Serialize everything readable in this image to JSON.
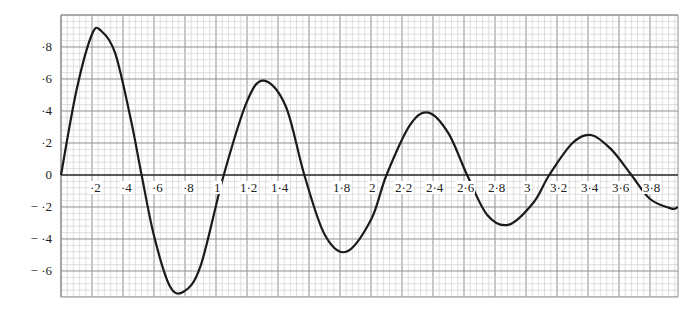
{
  "chart_data": {
    "type": "line",
    "title": "",
    "xlabel": "",
    "ylabel": "",
    "xlim": [
      0,
      3.98
    ],
    "ylim": [
      -0.76,
      1.0
    ],
    "grid": true,
    "x_tick_labels": [
      "·2",
      "·4",
      "·6",
      "·8",
      "1",
      "1·2",
      "1·4",
      "1·8",
      "2",
      "2·2",
      "2·4",
      "2·6",
      "2·8",
      "3",
      "3·2",
      "3·4",
      "3·6",
      "3·8"
    ],
    "x_tick_values": [
      0.2,
      0.4,
      0.6,
      0.8,
      1.0,
      1.2,
      1.4,
      1.8,
      2.0,
      2.2,
      2.4,
      2.6,
      2.8,
      3.0,
      3.2,
      3.4,
      3.6,
      3.8
    ],
    "y_tick_labels": [
      "·8",
      "·6",
      "·4",
      "·2",
      "0",
      "− ·2",
      "− ·4",
      "− ·6"
    ],
    "y_tick_values": [
      0.8,
      0.6,
      0.4,
      0.2,
      0,
      -0.2,
      -0.4,
      -0.6
    ],
    "series": [
      {
        "name": "damped oscillation",
        "x": [
          0,
          0.1,
          0.2,
          0.26,
          0.35,
          0.45,
          0.52,
          0.6,
          0.7,
          0.79,
          0.9,
          1.05,
          1.2,
          1.31,
          1.45,
          1.57,
          1.7,
          1.84,
          2.0,
          2.1,
          2.25,
          2.37,
          2.5,
          2.62,
          2.75,
          2.89,
          3.05,
          3.15,
          3.3,
          3.42,
          3.55,
          3.68,
          3.8,
          3.94,
          3.98
        ],
        "values": [
          0,
          0.53,
          0.88,
          0.9,
          0.76,
          0.35,
          0.0,
          -0.38,
          -0.69,
          -0.73,
          -0.57,
          0.0,
          0.46,
          0.59,
          0.43,
          0.0,
          -0.37,
          -0.48,
          -0.28,
          0.0,
          0.31,
          0.39,
          0.26,
          0.0,
          -0.25,
          -0.31,
          -0.17,
          0.0,
          0.2,
          0.25,
          0.16,
          0.0,
          -0.15,
          -0.21,
          -0.2
        ]
      }
    ]
  },
  "axes": {
    "x_labels": [
      "·2",
      "·4",
      "·6",
      "·8",
      "1",
      "1·2",
      "1·4",
      "1·8",
      "2",
      "2·2",
      "2·4",
      "2·6",
      "2·8",
      "3",
      "3·2",
      "3·4",
      "3·6",
      "3·8"
    ],
    "y_labels": [
      "·8",
      "·6",
      "·4",
      "·2",
      "0",
      "− ·2",
      "− ·4",
      "− ·6"
    ]
  },
  "colors": {
    "minor_grid": "#c9c9c9",
    "major_grid": "#8f8f8f",
    "curve": "#1a1a1a",
    "axis": "#333333"
  }
}
